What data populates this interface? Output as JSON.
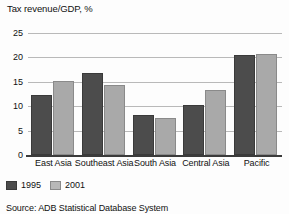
{
  "chart_data": {
    "type": "bar",
    "title": "Tax revenue/GDP, %",
    "xlabel": "",
    "ylabel": "",
    "ylim": [
      0,
      25
    ],
    "yticks": [
      0,
      5,
      10,
      15,
      20,
      25
    ],
    "ytick_labels": [
      "0",
      "5",
      "10",
      "15",
      "20",
      "25"
    ],
    "grid": true,
    "legend_position": "bottom-left",
    "categories": [
      "East Asia",
      "Southeast Asia",
      "South Asia",
      "Central Asia",
      "Pacific"
    ],
    "series": [
      {
        "name": "1995",
        "color": "#4c4c4c",
        "values": [
          12.2,
          16.8,
          8.3,
          10.2,
          20.5
        ]
      },
      {
        "name": "2001",
        "color": "#a9a9a9",
        "values": [
          15.2,
          14.4,
          7.6,
          13.3,
          20.6
        ]
      }
    ],
    "source": "Source: ADB Statistical Database System"
  }
}
